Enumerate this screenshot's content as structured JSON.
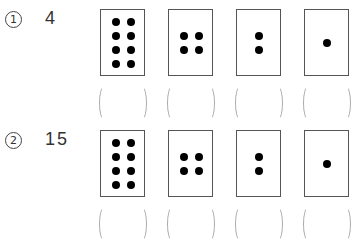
{
  "problems": [
    {
      "label_marker": "1",
      "value": "4",
      "cards": [
        {
          "dots": 8,
          "answer": ""
        },
        {
          "dots": 4,
          "answer": ""
        },
        {
          "dots": 2,
          "answer": ""
        },
        {
          "dots": 1,
          "answer": ""
        }
      ]
    },
    {
      "label_marker": "2",
      "value": "15",
      "cards": [
        {
          "dots": 8,
          "answer": ""
        },
        {
          "dots": 4,
          "answer": ""
        },
        {
          "dots": 2,
          "answer": ""
        },
        {
          "dots": 1,
          "answer": ""
        }
      ]
    }
  ],
  "colors": {
    "card_border": "#555555",
    "dot": "#000000",
    "paren": "#aaaaaa"
  }
}
